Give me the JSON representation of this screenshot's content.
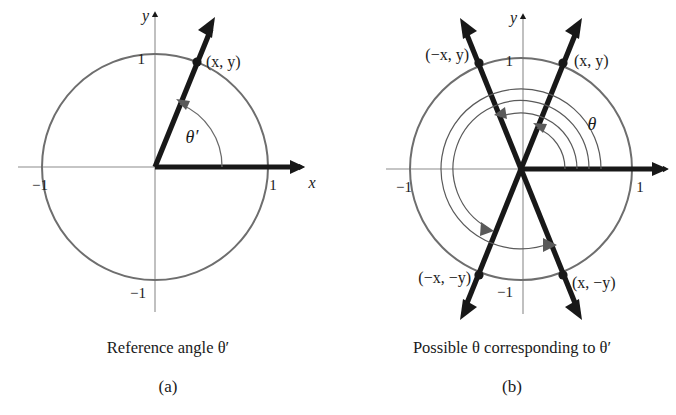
{
  "figure": {
    "title_implicit": "Reference angle and possible coterminal angles on the unit circle",
    "background_color": "#ffffff",
    "ink_color": "#181818",
    "circle_color": "#6e6e6e",
    "axis_color": "#8c8c8c"
  },
  "panel_a": {
    "id_label": "(a)",
    "caption": "Reference angle θ′",
    "axis_x_label": "x",
    "axis_y_label": "y",
    "tick_labels": {
      "x_pos": "1",
      "x_neg": "−1",
      "y_pos": "1",
      "y_neg": "−1"
    },
    "point_labels": [
      {
        "name": "point-xy",
        "text": "(x, y)"
      }
    ],
    "angle_label": "θ′",
    "geometry": {
      "center": [
        155,
        167
      ],
      "radius": 113,
      "ray_angle_deg": 68,
      "terminal_point_deg": 68,
      "initial_side_deg": 0
    }
  },
  "panel_b": {
    "id_label": "(b)",
    "caption": "Possible θ corresponding to θ′",
    "axis_x_label": "",
    "axis_y_label": "y",
    "tick_labels": {
      "x_pos": "1",
      "x_neg": "−1",
      "y_pos": "1",
      "y_neg": "−1"
    },
    "point_labels": [
      {
        "name": "point-xy",
        "text": "(x, y)",
        "quadrant": 1
      },
      {
        "name": "point-negx-y",
        "text": "(−x, y)",
        "quadrant": 2
      },
      {
        "name": "point-negx-negy",
        "text": "(−x, −y)",
        "quadrant": 3
      },
      {
        "name": "point-x-negy",
        "text": "(x, −y)",
        "quadrant": 4
      }
    ],
    "angle_label": "θ",
    "geometry": {
      "center": [
        521,
        169
      ],
      "radius": 111,
      "ray_angles_deg": [
        68,
        112,
        248,
        292
      ],
      "spiral_arc_radii": [
        44,
        56,
        68,
        80
      ],
      "spiral_arc_end_angles_deg": [
        68,
        112,
        248,
        292
      ]
    }
  }
}
